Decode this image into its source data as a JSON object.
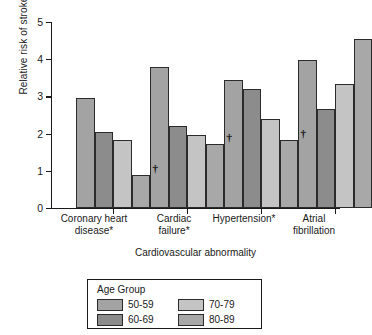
{
  "chart_data": {
    "type": "bar",
    "title": "",
    "subtitle": "",
    "xlabel": "Cardiovascular abnormality",
    "ylabel": "Relative risk of stroke",
    "categories": [
      "Coronary heart disease*",
      "Cardiac failure*",
      "Hypertension*",
      "Atrial fibrillation"
    ],
    "series": [
      {
        "name": "50-59",
        "color": "#a3a3a3",
        "values": [
          2.95,
          3.8,
          3.45,
          3.97
        ]
      },
      {
        "name": "60-69",
        "color": "#8c8c8c",
        "values": [
          2.03,
          2.21,
          3.21,
          2.67
        ]
      },
      {
        "name": "70-79",
        "color": "#c4c4c4",
        "values": [
          1.82,
          1.95,
          2.4,
          3.33
        ]
      },
      {
        "name": "80-89",
        "color": "#a8a8a8",
        "values": [
          0.89,
          1.72,
          1.83,
          4.53
        ]
      }
    ],
    "ylim": [
      0,
      5
    ],
    "yticks": [
      0,
      1,
      2,
      3,
      4,
      5
    ],
    "ytick_labels": [
      "0",
      "1",
      "2",
      "3",
      "4",
      "5"
    ],
    "grid": false,
    "legend_position": "bottom",
    "annotations": [
      {
        "symbol": "†",
        "group": "Coronary heart disease*",
        "series": "80-89",
        "y": 1.22
      },
      {
        "symbol": "†",
        "group": "Cardiac failure*",
        "series": "80-89",
        "y": 2.05
      },
      {
        "symbol": "†",
        "group": "Hypertension*",
        "series": "80-89",
        "y": 2.14
      }
    ]
  },
  "legend": {
    "title": "Age Group",
    "entries": [
      {
        "label": "50-59",
        "color": "#a3a3a3"
      },
      {
        "label": "70-79",
        "color": "#c4c4c4"
      },
      {
        "label": "60-69",
        "color": "#8c8c8c"
      },
      {
        "label": "80-89",
        "color": "#a8a8a8"
      }
    ]
  },
  "axis": {
    "y_title": "Relative risk of stroke",
    "x_title": "Cardiovascular abnormality",
    "ytick_0": "0",
    "ytick_1": "1",
    "ytick_2": "2",
    "ytick_3": "3",
    "ytick_4": "4",
    "ytick_5": "5"
  },
  "xlabels": {
    "g0_line1": "Coronary heart",
    "g0_line2": "disease*",
    "g1_line1": "Cardiac",
    "g1_line2": "failure*",
    "g2_line1": "Hypertension*",
    "g2_line2": "",
    "g3_line1": "Atrial",
    "g3_line2": "fibrillation"
  }
}
